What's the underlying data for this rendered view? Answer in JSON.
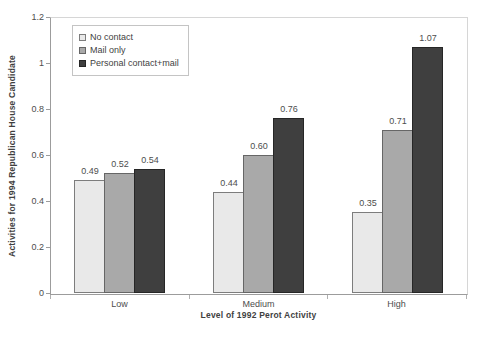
{
  "chart_data": {
    "type": "bar",
    "title": "",
    "xlabel": "Level of 1992 Perot Activity",
    "ylabel": "Activities for 1994 Republican House Candidate",
    "categories": [
      "Low",
      "Medium",
      "High"
    ],
    "series": [
      {
        "name": "No contact",
        "values": [
          0.49,
          0.44,
          0.35
        ],
        "fill": "#e9e9e9",
        "stroke": "#7d7d7d"
      },
      {
        "name": "Mail only",
        "values": [
          0.52,
          0.6,
          0.71
        ],
        "fill": "#a9a9a9",
        "stroke": "#666666"
      },
      {
        "name": "Personal contact+mail",
        "values": [
          0.54,
          0.76,
          1.07
        ],
        "fill": "#3f3f3f",
        "stroke": "#262626"
      }
    ],
    "ylim": [
      0,
      1.2
    ],
    "yticks": [
      0,
      0.2,
      0.4,
      0.6,
      0.8,
      1,
      1.2
    ],
    "ytick_labels": [
      "0",
      "0.2",
      "0.4",
      "0.6",
      "0.8",
      "1",
      "1.2"
    ],
    "data_labels": [
      [
        "0.49",
        "0.52",
        "0.54"
      ],
      [
        "0.44",
        "0.60",
        "0.76"
      ],
      [
        "0.35",
        "0.71",
        "1.07"
      ]
    ],
    "grid": false,
    "legend_position": "top-left-inside",
    "colors": {
      "axis_line": "#9c9c9c",
      "plot_border": "#d6d6d6",
      "tick_text": "#4d4d4d",
      "title_text": "#3f3f3f",
      "background": "#ffffff"
    }
  }
}
